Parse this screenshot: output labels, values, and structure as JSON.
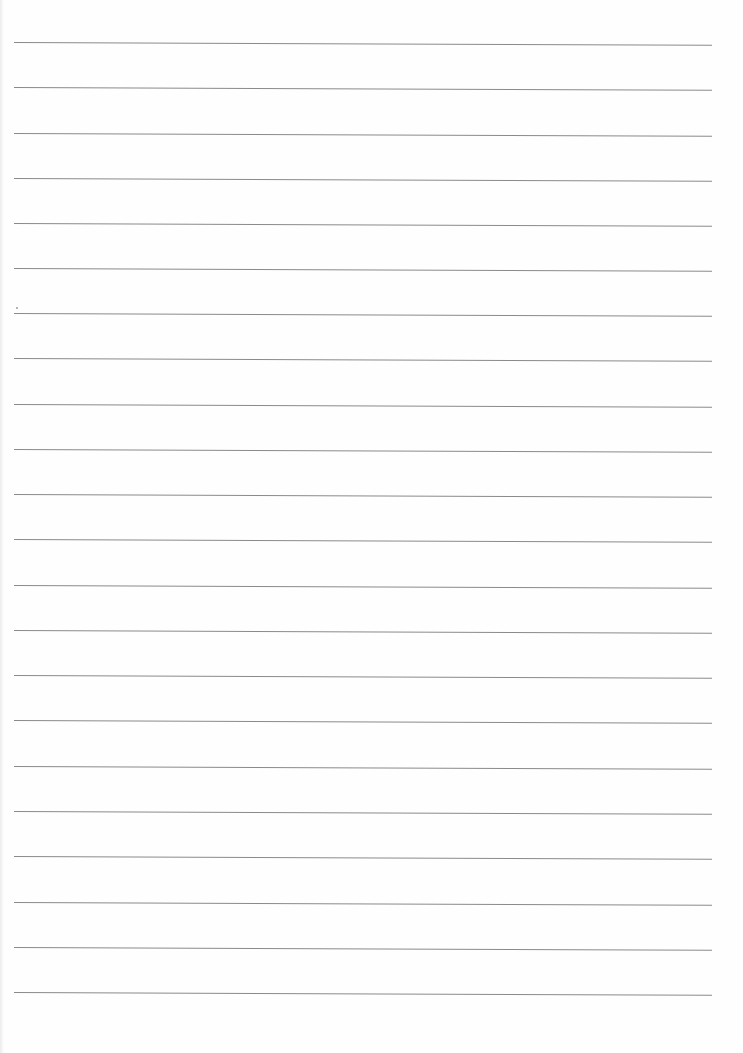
{
  "document": {
    "type": "lined-paper",
    "rule_count": 22,
    "rule_color": "#8a8a8a",
    "background_color": "#fefefe",
    "rules_y": [
      42,
      87,
      133,
      178,
      223,
      268,
      313,
      358,
      404,
      449,
      494,
      539,
      585,
      630,
      675,
      720,
      766,
      811,
      856,
      902,
      947,
      992
    ],
    "rule_x_start": 14,
    "rule_x_end": 712,
    "text": ""
  }
}
